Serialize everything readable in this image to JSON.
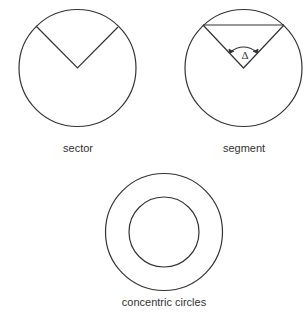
{
  "figures": [
    {
      "label": "sector"
    },
    {
      "label": "segment",
      "angle_symbol": "Δ"
    },
    {
      "label": "concentric circles"
    }
  ],
  "colors": {
    "stroke": "#333333",
    "background": "#ffffff"
  }
}
